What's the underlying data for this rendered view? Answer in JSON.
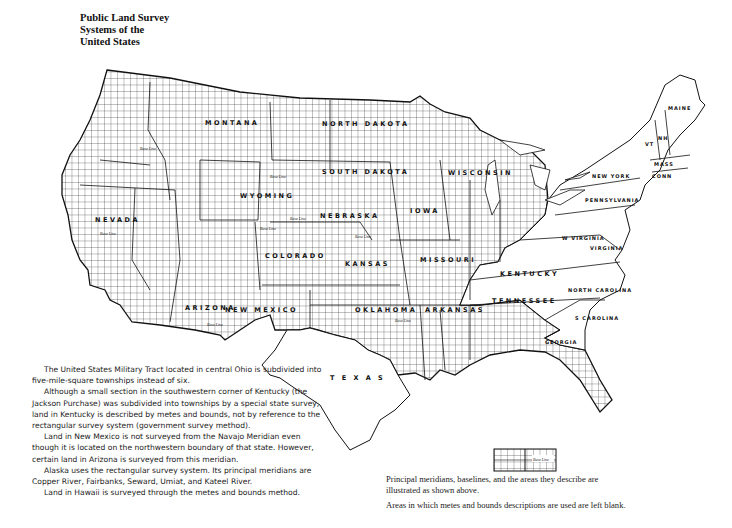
{
  "title": {
    "lines": [
      "Public Land Survey",
      "Systems of the",
      "United States"
    ]
  },
  "map": {
    "grid_color": "#333333",
    "outline_color": "#111111",
    "background": "#ffffff",
    "state_labels": {
      "north_dakota": "NORTH DAKOTA",
      "south_dakota": "SOUTH DAKOTA",
      "nebraska": "NEBRASKA",
      "kansas": "KANSAS",
      "oklahoma": "OKLAHOMA",
      "texas": "T E X A S",
      "iowa": "IOWA",
      "missouri": "MISSOURI",
      "arkansas": "ARKANSAS",
      "wisconsin": "WISCONSIN",
      "wyoming": "WYOMING",
      "colorado": "COLORADO",
      "montana": "MONTANA",
      "nevada": "NEVADA",
      "arizona": "ARIZONA",
      "new_mexico": "NEW MEXICO",
      "kentucky": "KENTUCKY",
      "tennessee": "TENNESSEE",
      "north_carolina": "NORTH CAROLINA",
      "south_carolina": "S CAROLINA",
      "georgia": "GEORGIA",
      "virginia": "VIRGINIA",
      "west_virginia": "W VIRGINIA",
      "pennsylvania": "PENNSYLVANIA",
      "new_york": "NEW YORK",
      "maine": "MAINE",
      "vermont": "VT",
      "new_hampshire": "NH",
      "massachusetts": "MASS",
      "connecticut": "CONN",
      "alabama": "ALA",
      "florida": "FLA"
    },
    "baseline_label": "Base Line"
  },
  "legend": {
    "sample_label": "Base Line"
  },
  "notes_left": [
    "The United States Military Tract located in central Ohio is subdivided into five-mile-square townships instead of six.",
    "Although a small section in the southwestern corner of Kentucky (the Jackson Purchase) was subdivided into townships by a special state survey, land in Kentucky is described by metes and bounds, not by reference to the rectangular survey system (government survey method).",
    "Land in New Mexico is not surveyed from the Navajo Meridian even though it is located on the northwestern boundary of that state. However, certain land in Arizona is surveyed from this meridian.",
    "Alaska uses the rectangular survey system. Its principal meridians are Copper River, Fairbanks, Seward, Umiat, and Kateel River.",
    "Land in Hawaii is surveyed through the metes and bounds method."
  ],
  "notes_right": [
    "Principal meridians, baselines, and the areas they describe are illustrated as shown above.",
    "Areas in which metes and bounds descriptions are used are left blank."
  ]
}
